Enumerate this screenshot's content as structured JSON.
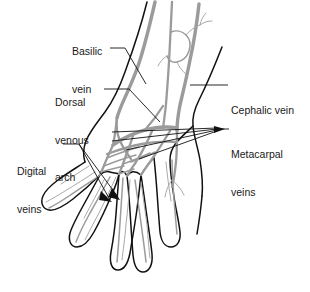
{
  "figure": {
    "view": "dorsal view of right hand and distal forearm"
  },
  "colors": {
    "vein": "#9b9b9b",
    "vein_fine": "#a8a8a8",
    "outline": "#111111",
    "leader": "#111111",
    "background": "#ffffff",
    "text": "#1a1a1a"
  },
  "labels": {
    "basilic": {
      "line1": "Basilic",
      "line2": "vein",
      "full": "Basilic vein"
    },
    "dorsal": {
      "line1": "Dorsal",
      "line2": "venous",
      "line3": "arch",
      "full": "Dorsal venous arch"
    },
    "cephalic": {
      "line1": "Cephalic vein",
      "full": "Cephalic vein"
    },
    "metacarpal": {
      "line1": "Metacarpal",
      "line2": "veins",
      "full": "Metacarpal veins"
    },
    "digital": {
      "line1": "Digital",
      "line2": "veins",
      "full": "Digital veins"
    }
  },
  "structures": [
    {
      "name": "basilic-vein",
      "side": "medial",
      "label": "Basilic vein"
    },
    {
      "name": "cephalic-vein",
      "side": "lateral",
      "label": "Cephalic vein"
    },
    {
      "name": "dorsal-venous-arch",
      "side": "central",
      "label": "Dorsal venous arch"
    },
    {
      "name": "metacarpal-veins",
      "side": "central",
      "label": "Metacarpal veins",
      "count": 4
    },
    {
      "name": "digital-veins",
      "side": "distal",
      "label": "Digital veins",
      "count": 5
    }
  ]
}
